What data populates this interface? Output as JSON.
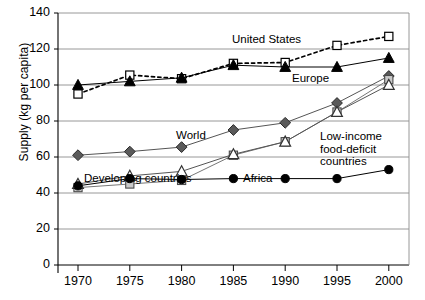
{
  "chart_data": {
    "type": "line",
    "title": "",
    "xlabel": "",
    "ylabel": "Supply (kg per capita)",
    "x": [
      1970,
      1975,
      1980,
      1985,
      1990,
      1995,
      2000
    ],
    "xtick_labels": [
      "1970",
      "1975",
      "1980",
      "1985",
      "1990",
      "1995",
      "2000"
    ],
    "ytick_labels": [
      "0",
      "20",
      "40",
      "60",
      "80",
      "100",
      "120",
      "140"
    ],
    "ytick_values": [
      0,
      20,
      40,
      60,
      80,
      100,
      120,
      140
    ],
    "xlim": [
      1968,
      2002
    ],
    "ylim": [
      0,
      140
    ],
    "grid": "horizontal",
    "legend_position": "inline-annotations",
    "series": [
      {
        "name": "United States",
        "marker": "open-square",
        "line": "dashed",
        "color": "#000000",
        "values": [
          95,
          105.5,
          103.5,
          112,
          112.5,
          122,
          127
        ]
      },
      {
        "name": "Europe",
        "marker": "filled-triangle",
        "line": "solid",
        "color": "#000000",
        "values": [
          100,
          102,
          104,
          111,
          110,
          110,
          115
        ]
      },
      {
        "name": "World",
        "marker": "filled-diamond",
        "line": "solid",
        "color": "#555555",
        "values": [
          61,
          63,
          65.5,
          75,
          79,
          90,
          105
        ]
      },
      {
        "name": "Low-income food-deficit countries",
        "marker": "open-square-gray",
        "line": "solid",
        "color": "#777777",
        "values": [
          43,
          45,
          47,
          61,
          68.5,
          85,
          103
        ]
      },
      {
        "name": "Developing countries",
        "marker": "open-triangle",
        "line": "solid",
        "color": "#555555",
        "values": [
          45,
          49.5,
          52,
          61.5,
          68.5,
          85,
          100
        ]
      },
      {
        "name": "Africa",
        "marker": "filled-circle",
        "line": "solid",
        "color": "#000000",
        "values": [
          44,
          48,
          47.5,
          48,
          48,
          48,
          53
        ]
      }
    ],
    "annotations": [
      {
        "text": "United States",
        "x_px": 232,
        "y_px": 33
      },
      {
        "text": "Europe",
        "x_px": 292,
        "y_px": 72
      },
      {
        "text": "World",
        "x_px": 176,
        "y_px": 129
      },
      {
        "text": "Low-income\nfood-deficit\ncountries",
        "x_px": 320,
        "y_px": 130
      },
      {
        "text": "Developing countries",
        "x_px": 84,
        "y_px": 172
      },
      {
        "text": "Africa",
        "x_px": 243,
        "y_px": 172
      }
    ]
  }
}
